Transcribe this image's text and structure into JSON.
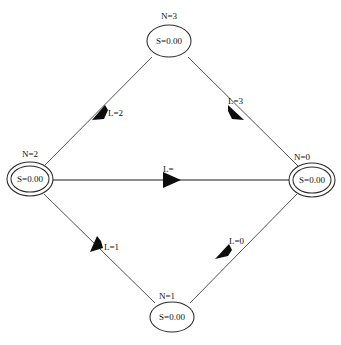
{
  "diagram": {
    "type": "state-transition-graph",
    "background_color": "#ffffff",
    "line_color": "#3d3d3d",
    "text_color": "#101010",
    "nodes": [
      {
        "id": "n3",
        "outer_label": "N=3",
        "inner_label": "S=0.00",
        "shape": "ellipse",
        "double": false,
        "cx": 169,
        "cy": 41
      },
      {
        "id": "n2",
        "outer_label": "N=2",
        "inner_label": "S=0.00",
        "shape": "double-ellipse",
        "double": true,
        "cx": 30,
        "cy": 179
      },
      {
        "id": "n0",
        "outer_label": "N=0",
        "inner_label": "S=0.00",
        "shape": "double-ellipse",
        "double": true,
        "cx": 312,
        "cy": 180
      },
      {
        "id": "n1",
        "outer_label": "N=1",
        "inner_label": "S=0.00",
        "shape": "ellipse",
        "double": false,
        "cx": 172,
        "cy": 317
      }
    ],
    "edges": [
      {
        "id": "e-n3-n2",
        "from": "n3",
        "to": "n2",
        "label": "L=2",
        "label_x": 108,
        "label_y": 112,
        "direction": "down-left"
      },
      {
        "id": "e-n3-n0",
        "from": "n3",
        "to": "n0",
        "label": "L=3",
        "label_x": 231,
        "label_y": 102,
        "direction": "down-right"
      },
      {
        "id": "e-n2-n0",
        "from": "n2",
        "to": "n0",
        "label": "L=",
        "label_x": 166,
        "label_y": 172,
        "direction": "right"
      },
      {
        "id": "e-n1-n2",
        "from": "n1",
        "to": "n2",
        "label": "L=1",
        "label_x": 104,
        "label_y": 245,
        "direction": "up-left"
      },
      {
        "id": "e-n0-n1",
        "from": "n0",
        "to": "n1",
        "label": "L=0",
        "label_x": 232,
        "label_y": 240,
        "direction": "down-left"
      }
    ],
    "footer_partial_text": ""
  }
}
